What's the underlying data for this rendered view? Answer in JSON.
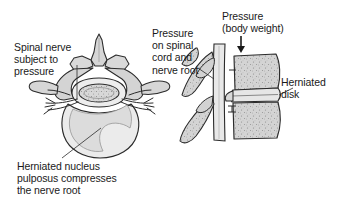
{
  "figure": {
    "background_color": "#ffffff",
    "text_color": "#1a1a1a",
    "line_color": "#2b2b2b",
    "bone_fill": "#d6d6d6",
    "disk_fill": "#eaeaea",
    "cord_fill": "#e2e2e2"
  },
  "labels": {
    "spinal_nerve": "Spinal nerve\nsubject to\npressure",
    "pressure_cord": "Pressure\non spinal\ncord and\nnerve root",
    "pressure_weight": "Pressure\n(body weight)",
    "herniated_disk": "Herniated\ndisk",
    "herniated_nucleus": "Herniated nucleus\npulposus compresses\nthe nerve root"
  },
  "views": {
    "axial": {
      "name": "axial cross-section of vertebra",
      "parts": [
        "spinous-process",
        "lamina",
        "transverse-process-left",
        "transverse-process-right",
        "spinal-canal",
        "spinal-cord",
        "nerve-root-left",
        "nerve-root-right",
        "vertebral-body",
        "herniated-nucleus-pulposus"
      ]
    },
    "lateral": {
      "name": "lateral section of spine",
      "parts": [
        "vertebral-body-upper",
        "vertebral-body-lower",
        "herniated-disk",
        "spinal-cord-column",
        "spinous-process-upper",
        "spinous-process-lower",
        "pressure-arrow"
      ]
    }
  },
  "annotations": {
    "pressure_arrow_direction": "down"
  }
}
